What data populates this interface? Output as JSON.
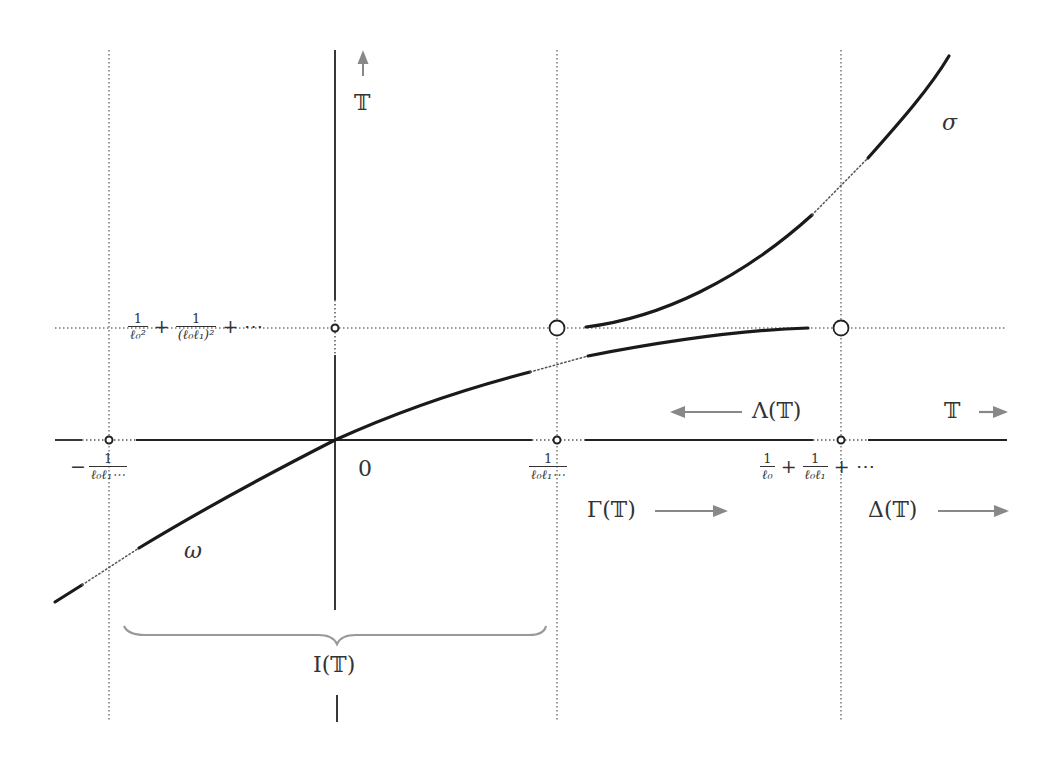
{
  "diagram": {
    "labels": {
      "vertical_axis": "𝕋",
      "horizontal_axis": "𝕋",
      "origin": "0",
      "curve_upper": "σ",
      "curve_lower": "ω",
      "lambda": "Λ(𝕋)",
      "gamma": "Γ(𝕋)",
      "delta": "Δ(𝕋)",
      "interval": "I(𝕋)"
    },
    "ticks": {
      "neg": {
        "sign": "−",
        "num": "1",
        "den": "ℓ₀ℓ₁⋯"
      },
      "mid": {
        "num": "1",
        "den": "ℓ₀ℓ₁⋯"
      },
      "right": {
        "term1": {
          "num": "1",
          "den": "ℓ₀"
        },
        "plus1": "+",
        "term2": {
          "num": "1",
          "den": "ℓ₀ℓ₁"
        },
        "plus2": "+",
        "ellipsis": "⋯"
      },
      "vertical": {
        "term1": {
          "num": "1",
          "den": "ℓ₀²"
        },
        "plus1": "+",
        "term2": {
          "num": "1",
          "den": "(ℓ₀ℓ₁)²"
        },
        "plus2": "+",
        "ellipsis": "⋯"
      }
    },
    "colors": {
      "axis": "#222222",
      "curve": "#1a1a1a",
      "dotted": "#777777",
      "arrow": "#888888",
      "brace": "#999999"
    }
  }
}
